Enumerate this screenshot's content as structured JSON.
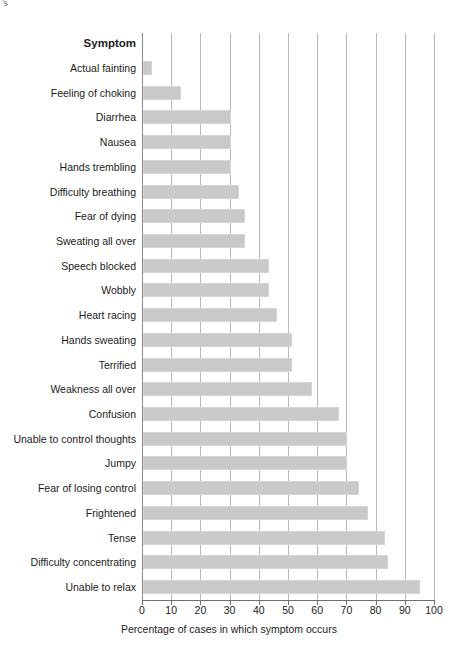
{
  "page": {
    "corner_artifact": "’s"
  },
  "chart_data": {
    "type": "bar",
    "orientation": "horizontal",
    "title": "",
    "xlabel": "Percentage of cases in which symptom occurs",
    "ylabel": "Symptom",
    "category_header": "Symptom",
    "xlim": [
      0,
      100
    ],
    "xticks": [
      0,
      10,
      20,
      30,
      40,
      50,
      60,
      70,
      80,
      90,
      100
    ],
    "xtick_labels": [
      "0",
      "10",
      "20",
      "30",
      "40",
      "50",
      "60",
      "70",
      "80",
      "90",
      "100"
    ],
    "grid": "vertical",
    "legend": "none",
    "bar_color": "#c9c9c9",
    "categories": [
      "Actual fainting",
      "Feeling of choking",
      "Diarrhea",
      "Nausea",
      "Hands trembling",
      "Difficulty breathing",
      "Fear of dying",
      "Sweating all over",
      "Speech blocked",
      "Wobbly",
      "Heart racing",
      "Hands sweating",
      "Terrified",
      "Weakness all over",
      "Confusion",
      "Unable to control thoughts",
      "Jumpy",
      "Fear of losing control",
      "Frightened",
      "Tense",
      "Difficulty concentrating",
      "Unable to relax"
    ],
    "values": [
      3,
      13,
      30,
      30,
      30,
      33,
      35,
      35,
      43,
      43,
      46,
      51,
      51,
      58,
      67,
      70,
      70,
      74,
      77,
      83,
      84,
      95
    ]
  }
}
